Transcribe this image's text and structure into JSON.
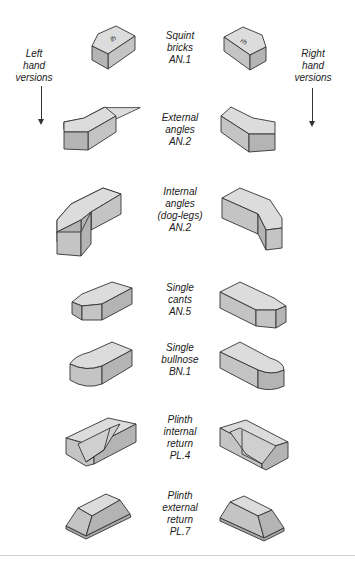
{
  "side_labels": {
    "left": [
      "Left",
      "hand",
      "versions"
    ],
    "right": [
      "Right",
      "hand",
      "versions"
    ]
  },
  "bricks": [
    {
      "lines": [
        "Squint",
        "bricks",
        "AN.1"
      ],
      "left_mark": "lh",
      "right_mark": "rh"
    },
    {
      "lines": [
        "External",
        "angles",
        "AN.2"
      ]
    },
    {
      "lines": [
        "Internal",
        "angles",
        "(dog-legs)",
        "AN.2"
      ]
    },
    {
      "lines": [
        "Single",
        "cants",
        "AN.5"
      ]
    },
    {
      "lines": [
        "Single",
        "bullnose",
        "BN.1"
      ]
    },
    {
      "lines": [
        "Plinth",
        "internal",
        "return",
        "PL.4"
      ]
    },
    {
      "lines": [
        "Plinth",
        "external",
        "return",
        "PL.7"
      ]
    }
  ]
}
